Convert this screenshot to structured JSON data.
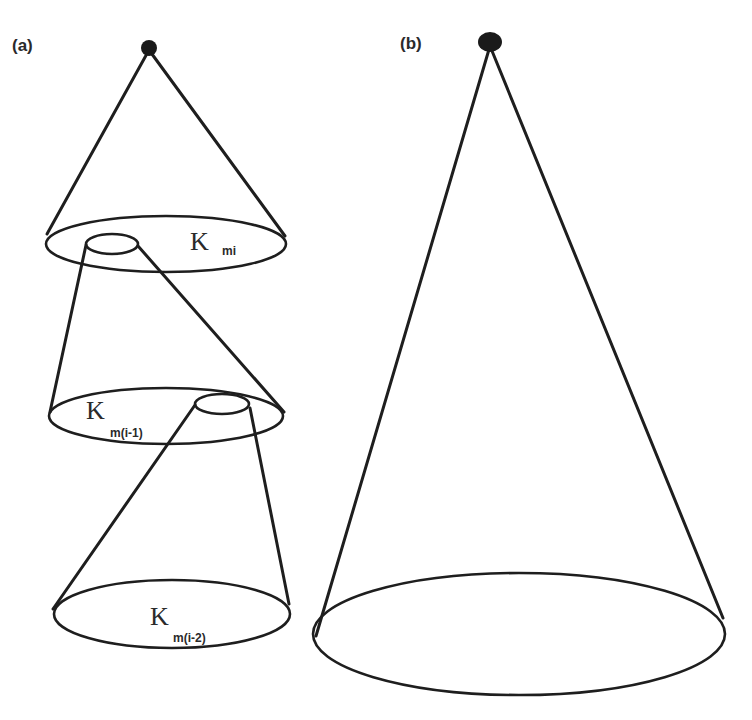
{
  "figure": {
    "panels": [
      {
        "id": "a",
        "label": "(a)",
        "description": "Stack of three nested cone-like levels, each level's small top ellipse feeding into the next cone",
        "levels": [
          {
            "symbol": "K",
            "subscript": "mi"
          },
          {
            "symbol": "K",
            "subscript": "m(i-1)"
          },
          {
            "symbol": "K",
            "subscript": "m(i-2)"
          }
        ]
      },
      {
        "id": "b",
        "label": "(b)",
        "description": "Single large cone with apex dot and elliptical base"
      }
    ],
    "colors": {
      "stroke": "#1e1e1e",
      "text": "#2a2a2a",
      "background": "#ffffff"
    }
  }
}
